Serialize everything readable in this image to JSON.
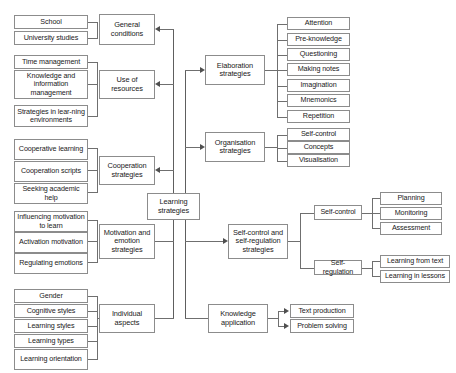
{
  "diagram": {
    "type": "hierarchical-tree-diagram",
    "root": {
      "id": "learning-strategies",
      "label": "Learning strategies"
    },
    "colors": {
      "box_border": "#8c8c8c",
      "box_fill": "#ffffff",
      "connector": "#6f6f6f",
      "arrow": "#4f4f4f",
      "text": "#1a1a1a"
    },
    "categories": [
      {
        "id": "general-conditions",
        "label": "General conditions",
        "side": "left",
        "children": [
          {
            "label": "School"
          },
          {
            "label": "University studies"
          }
        ]
      },
      {
        "id": "use-of-resources",
        "label": "Use of resources",
        "side": "left",
        "children": [
          {
            "label": "Time management"
          },
          {
            "label": "Knowledge and information management"
          },
          {
            "label": "Strategies in lear-ning environments"
          }
        ]
      },
      {
        "id": "cooperation-strategies",
        "label": "Cooperation strategies",
        "side": "left",
        "children": [
          {
            "label": "Cooperative learning"
          },
          {
            "label": "Cooperation scripts"
          },
          {
            "label": "Seeking academic help"
          }
        ]
      },
      {
        "id": "motivation-and-emotion-strategies",
        "label": "Motivation and emotion strategies",
        "side": "left",
        "children": [
          {
            "label": "Influencing motivation to learn"
          },
          {
            "label": "Activation motivation"
          },
          {
            "label": "Regulating emotions"
          }
        ]
      },
      {
        "id": "individual-aspects",
        "label": "Individual aspects",
        "side": "left",
        "children": [
          {
            "label": "Gender"
          },
          {
            "label": "Cognitive styles"
          },
          {
            "label": "Learning styles"
          },
          {
            "label": "Learning types"
          },
          {
            "label": "Learning orientation"
          }
        ]
      },
      {
        "id": "elaboration-strategies",
        "label": "Elaboration strategies",
        "side": "right",
        "children": [
          {
            "label": "Attention"
          },
          {
            "label": "Pre-knowledge"
          },
          {
            "label": "Questioning"
          },
          {
            "label": "Making notes"
          },
          {
            "label": "Imagination"
          },
          {
            "label": "Mnemonics"
          },
          {
            "label": "Repetition"
          }
        ]
      },
      {
        "id": "organisation-strategies",
        "label": "Organisation strategies",
        "side": "right",
        "children": [
          {
            "label": "Self-control"
          },
          {
            "label": "Concepts"
          },
          {
            "label": "Visualisation"
          }
        ]
      },
      {
        "id": "self-control-and-self-regulation-strategies",
        "label": "Self-control and self-regulation strategies",
        "side": "right",
        "children": [
          {
            "label": "Self-control",
            "children": [
              {
                "label": "Planning"
              },
              {
                "label": "Monitoring"
              },
              {
                "label": "Assessment"
              }
            ]
          },
          {
            "label": "Self-regulation",
            "children": [
              {
                "label": "Learning from text"
              },
              {
                "label": "Learning in lessons"
              }
            ]
          }
        ]
      },
      {
        "id": "knowledge-application",
        "label": "Knowledge application",
        "side": "right",
        "children": [
          {
            "label": "Text production"
          },
          {
            "label": "Problem solving"
          }
        ]
      }
    ]
  }
}
